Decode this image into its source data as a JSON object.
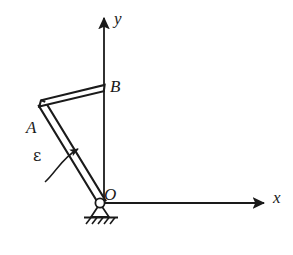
{
  "figure": {
    "background_color": "#ffffff",
    "line_color": "#1a1a1a",
    "axes": {
      "origin": {
        "x": 104,
        "y": 203
      },
      "x_axis": {
        "label": "x",
        "from": {
          "x": 104,
          "y": 203
        },
        "to": {
          "x": 268,
          "y": 203
        },
        "arrow": "end"
      },
      "y_axis": {
        "label": "y",
        "from": {
          "x": 104,
          "y": 203
        },
        "to": {
          "x": 104,
          "y": 14
        },
        "arrow": "end"
      }
    },
    "points": [
      {
        "name": "A",
        "label": "A",
        "x": 42,
        "y": 103,
        "label_offset": {
          "dx": -16,
          "dy": 16
        }
      },
      {
        "name": "B",
        "label": "B",
        "x": 104,
        "y": 88,
        "label_offset": {
          "dx": 6,
          "dy": -10
        }
      },
      {
        "name": "O",
        "label": "O",
        "x": 104,
        "y": 203,
        "label_offset": {
          "dx": 0,
          "dy": -17
        }
      }
    ],
    "bars": [
      {
        "name": "bar-OA",
        "from": "O",
        "to": "A",
        "style": "hollow-rod",
        "thickness": 6
      },
      {
        "name": "bar-AB",
        "from": "A",
        "to": "B",
        "style": "hollow-rod",
        "thickness": 6
      }
    ],
    "support": {
      "type": "pin-support",
      "at": "O",
      "pin_radius": 5,
      "ground_line_half_width": 17,
      "hatch_count": 6
    },
    "annotations": [
      {
        "name": "angular-acceleration",
        "symbol": "ε",
        "type": "curved-arrow",
        "direction": "counterclockwise-toward-y-axis",
        "label_position": {
          "x": 33,
          "y": 148
        }
      }
    ]
  }
}
